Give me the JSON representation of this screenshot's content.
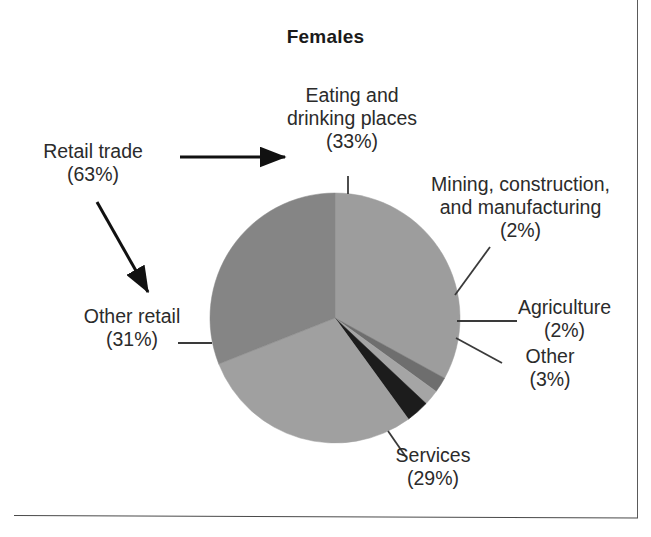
{
  "figure": {
    "title": "Females",
    "background_color": "#ffffff",
    "text_color": "#2b2b2b",
    "frame": {
      "right_rule_color": "#5a5a5a",
      "bottom_rule_color": "#4a4a4a"
    }
  },
  "labels": {
    "eating": "Eating and\ndrinking places\n(33%)",
    "retail_trade": "Retail trade\n(63%)",
    "other_retail": "Other retail\n(31%)",
    "mining": "Mining, construction,\nand manufacturing\n(2%)",
    "agriculture": "Agriculture\n(2%)",
    "other": "Other\n(3%)",
    "services": "Services\n(29%)"
  },
  "chart_data": {
    "type": "pie",
    "title": "Females",
    "xlabel": "",
    "ylabel": "",
    "units": "percent",
    "total": 100,
    "start_angle_deg": 0,
    "direction": "clockwise",
    "center": {
      "x": 335,
      "y": 318
    },
    "radius": 125,
    "legend_position": "none",
    "labels_as": "callouts",
    "categories": [
      "Eating and drinking places",
      "Mining, construction, and manufacturing",
      "Agriculture",
      "Other",
      "Services",
      "Other retail"
    ],
    "values": [
      33,
      2,
      2,
      3,
      29,
      31
    ],
    "value_labels": [
      "(33%)",
      "(2%)",
      "(2%)",
      "(3%)",
      "(29%)",
      "(31%)"
    ],
    "colors": [
      "#9d9d9d",
      "#6e6e6e",
      "#a5a5a5",
      "#1c1c1c",
      "#a0a0a0",
      "#858585"
    ],
    "slices": [
      {
        "name": "Eating and drinking places",
        "value": 33,
        "color": "#9d9d9d",
        "start_deg": 0,
        "end_deg": 118.8
      },
      {
        "name": "Mining, construction, and manufacturing",
        "value": 2,
        "color": "#6e6e6e",
        "start_deg": 118.8,
        "end_deg": 126.0
      },
      {
        "name": "Agriculture",
        "value": 2,
        "color": "#a5a5a5",
        "start_deg": 126.0,
        "end_deg": 133.2
      },
      {
        "name": "Other",
        "value": 3,
        "color": "#1c1c1c",
        "start_deg": 133.2,
        "end_deg": 144.0
      },
      {
        "name": "Services",
        "value": 29,
        "color": "#a0a0a0",
        "start_deg": 144.0,
        "end_deg": 248.4
      },
      {
        "name": "Other retail",
        "value": 31,
        "color": "#858585",
        "start_deg": 248.4,
        "end_deg": 360.0
      }
    ],
    "annotations": [
      {
        "text": "Retail trade",
        "value": 63,
        "note": "grouping of Other retail (31%) and Eating and drinking places (33%)"
      }
    ]
  }
}
